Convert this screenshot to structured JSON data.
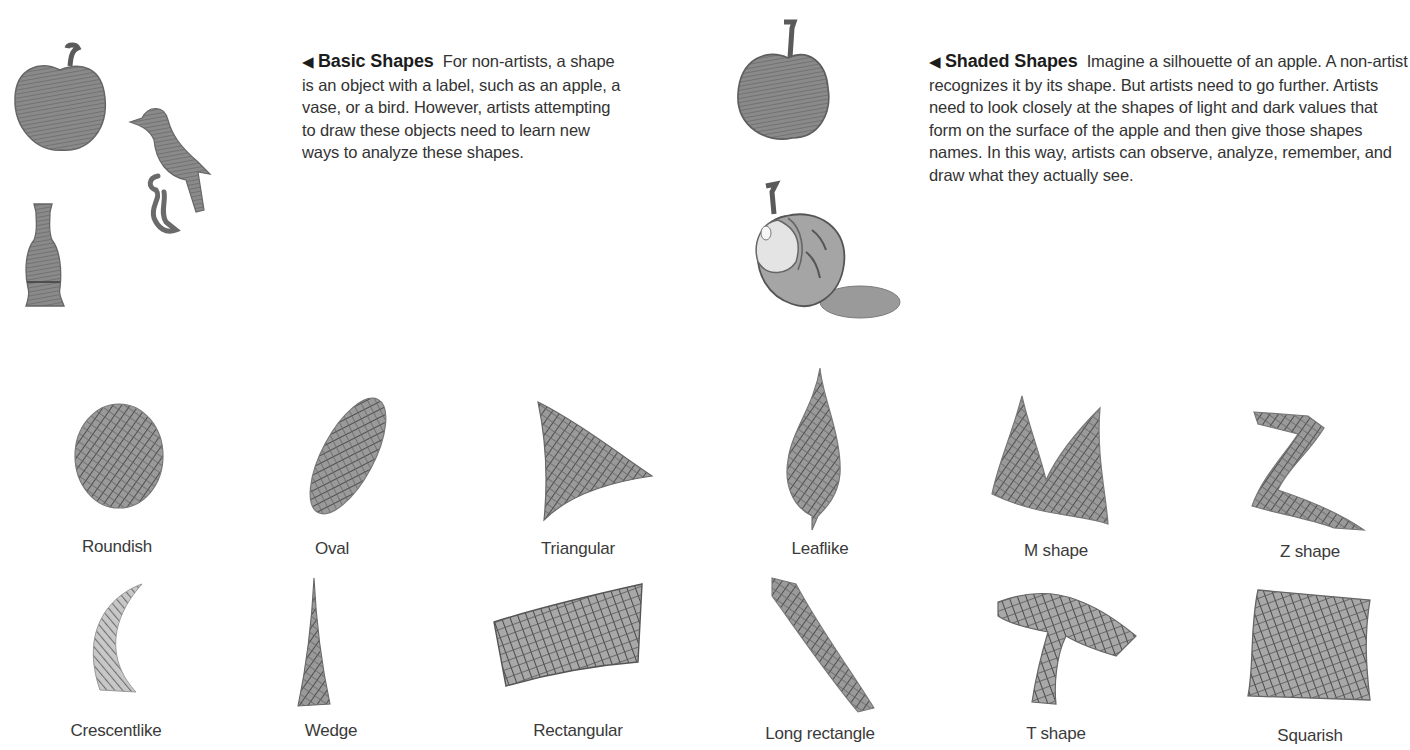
{
  "captions": {
    "basic": {
      "arrow": "◀",
      "title": "Basic Shapes",
      "body": "For non-artists, a shape is an object with a label, such as an apple, a vase, or a bird. However, artists attempting to draw these objects need to learn new ways to analyze these shapes."
    },
    "shaded": {
      "arrow": "◀",
      "title": "Shaded Shapes",
      "body": "Imagine a silhouette of an apple. A non-artist recognizes it by its shape. But artists need to go further. Artists need to look closely at the shapes of light and dark values that form on the surface of the apple and then give those shapes names. In this way, artists can observe, analyze, remember, and draw what they actually see."
    }
  },
  "illustrations": {
    "basic": [
      "apple",
      "bird",
      "vase"
    ],
    "shaded": [
      "apple silhouette",
      "shaded apple with shadow"
    ]
  },
  "shapes": {
    "row1": [
      {
        "label": "Roundish"
      },
      {
        "label": "Oval"
      },
      {
        "label": "Triangular"
      },
      {
        "label": "Leaflike"
      },
      {
        "label": "M shape"
      },
      {
        "label": "Z shape"
      }
    ],
    "row2": [
      {
        "label": "Crescentlike"
      },
      {
        "label": "Wedge"
      },
      {
        "label": "Rectangular"
      },
      {
        "label": "Long rectangle"
      },
      {
        "label": "T shape"
      },
      {
        "label": "Squarish"
      }
    ]
  },
  "colors": {
    "pencil": "#6b6b6b",
    "pencil_dark": "#4a4a4a",
    "text": "#333333"
  }
}
